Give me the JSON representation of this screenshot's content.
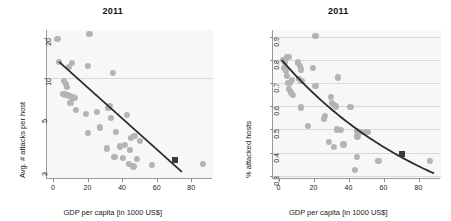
{
  "figure": {
    "background": "#ffffff",
    "point_color": "#b4b4b4",
    "highlight_color": "#3a3a3a",
    "fit_color": "#2b2b2b",
    "grid_color": "#d9d9d9",
    "panel_background": "#f7f7f7"
  },
  "chart_data": [
    {
      "type": "scatter",
      "title": "2011",
      "xlabel": "GDP per capita [in 1000 US$]",
      "ylabel": "Avg. # attacks per host",
      "xlim": [
        -4,
        92
      ],
      "ylim": [
        1.8,
        23
      ],
      "yscale": "log",
      "xscale": "linear",
      "xticks": [
        0,
        20,
        40,
        60,
        80
      ],
      "xtick_labels": [
        "0",
        "20",
        "40",
        "60",
        "80"
      ],
      "yticks": [
        2,
        5,
        10,
        20
      ],
      "ytick_labels": [
        "2",
        "5",
        "10",
        "20"
      ],
      "grid": "horizontal-at-10",
      "gridlines_y": [
        10
      ],
      "legend": "none",
      "points": [
        {
          "x": 2.0,
          "y": 19.8
        },
        {
          "x": 20.5,
          "y": 21.5
        },
        {
          "x": 3.0,
          "y": 13.2
        },
        {
          "x": 8.5,
          "y": 12.1
        },
        {
          "x": 10.5,
          "y": 13.0
        },
        {
          "x": 19.5,
          "y": 12.4
        },
        {
          "x": 34.0,
          "y": 11.0
        },
        {
          "x": 6.0,
          "y": 9.6
        },
        {
          "x": 7.0,
          "y": 9.1
        },
        {
          "x": 7.5,
          "y": 8.6
        },
        {
          "x": 5.5,
          "y": 7.7
        },
        {
          "x": 6.5,
          "y": 7.6
        },
        {
          "x": 8.0,
          "y": 7.5
        },
        {
          "x": 9.0,
          "y": 7.4
        },
        {
          "x": 10.0,
          "y": 7.3
        },
        {
          "x": 11.0,
          "y": 7.2
        },
        {
          "x": 12.0,
          "y": 7.1
        },
        {
          "x": 9.5,
          "y": 6.6
        },
        {
          "x": 12.5,
          "y": 5.8
        },
        {
          "x": 18.5,
          "y": 5.4
        },
        {
          "x": 25.0,
          "y": 5.6
        },
        {
          "x": 31.5,
          "y": 6.0
        },
        {
          "x": 32.5,
          "y": 6.2
        },
        {
          "x": 33.0,
          "y": 5.1
        },
        {
          "x": 42.0,
          "y": 5.3
        },
        {
          "x": 19.5,
          "y": 3.9
        },
        {
          "x": 26.5,
          "y": 4.3
        },
        {
          "x": 36.0,
          "y": 4.0
        },
        {
          "x": 44.5,
          "y": 3.6
        },
        {
          "x": 46.5,
          "y": 3.7
        },
        {
          "x": 49.5,
          "y": 3.4
        },
        {
          "x": 30.5,
          "y": 3.0
        },
        {
          "x": 38.0,
          "y": 3.1
        },
        {
          "x": 41.0,
          "y": 3.2
        },
        {
          "x": 44.0,
          "y": 2.9
        },
        {
          "x": 35.0,
          "y": 2.6
        },
        {
          "x": 40.0,
          "y": 2.55
        },
        {
          "x": 43.5,
          "y": 2.3
        },
        {
          "x": 48.0,
          "y": 2.5
        },
        {
          "x": 46.0,
          "y": 2.2
        },
        {
          "x": 56.5,
          "y": 2.25
        },
        {
          "x": 86.0,
          "y": 2.3
        }
      ],
      "highlight_point": {
        "x": 70.0,
        "y": 2.45,
        "marker": "square"
      },
      "fit": {
        "type": "log-linear",
        "x_start": 3.0,
        "y_start": 13.3,
        "x_end": 74.0,
        "y_end": 2.0
      }
    },
    {
      "type": "scatter",
      "title": "2011",
      "xlabel": "GDP per capita [in 1000 US$]",
      "ylabel": "% attacked hosts",
      "xlim": [
        -4,
        92
      ],
      "ylim": [
        0.29,
        0.93
      ],
      "yscale": "linear",
      "xscale": "linear",
      "xticks": [
        0,
        20,
        40,
        60,
        80
      ],
      "xtick_labels": [
        "0",
        "20",
        "40",
        "60",
        "80"
      ],
      "yticks": [
        0.3,
        0.4,
        0.5,
        0.6,
        0.7,
        0.8,
        0.9
      ],
      "ytick_labels": [
        "0.3",
        "0.4",
        "0.5",
        "0.6",
        "0.7",
        "0.8",
        "0.9"
      ],
      "grid": "horizontal",
      "gridlines_y": [
        0.3,
        0.4,
        0.5,
        0.6,
        0.7,
        0.8,
        0.9
      ],
      "legend": "none",
      "points": [
        {
          "x": 20.5,
          "y": 0.905
        },
        {
          "x": 2.0,
          "y": 0.8
        },
        {
          "x": 3.0,
          "y": 0.79
        },
        {
          "x": 4.5,
          "y": 0.815
        },
        {
          "x": 5.5,
          "y": 0.815
        },
        {
          "x": 2.5,
          "y": 0.765
        },
        {
          "x": 3.5,
          "y": 0.755
        },
        {
          "x": 10.5,
          "y": 0.79
        },
        {
          "x": 11.5,
          "y": 0.775
        },
        {
          "x": 12.0,
          "y": 0.76
        },
        {
          "x": 19.0,
          "y": 0.765
        },
        {
          "x": 4.0,
          "y": 0.73
        },
        {
          "x": 5.0,
          "y": 0.7
        },
        {
          "x": 6.0,
          "y": 0.7
        },
        {
          "x": 7.0,
          "y": 0.715
        },
        {
          "x": 11.0,
          "y": 0.72
        },
        {
          "x": 12.5,
          "y": 0.71
        },
        {
          "x": 20.5,
          "y": 0.69
        },
        {
          "x": 33.5,
          "y": 0.725
        },
        {
          "x": 5.5,
          "y": 0.675
        },
        {
          "x": 6.5,
          "y": 0.66
        },
        {
          "x": 7.5,
          "y": 0.65
        },
        {
          "x": 29.5,
          "y": 0.64
        },
        {
          "x": 30.0,
          "y": 0.615
        },
        {
          "x": 31.0,
          "y": 0.605
        },
        {
          "x": 32.0,
          "y": 0.6
        },
        {
          "x": 12.0,
          "y": 0.595
        },
        {
          "x": 40.5,
          "y": 0.597
        },
        {
          "x": 26.0,
          "y": 0.56
        },
        {
          "x": 25.5,
          "y": 0.545
        },
        {
          "x": 16.0,
          "y": 0.515
        },
        {
          "x": 33.0,
          "y": 0.5
        },
        {
          "x": 35.0,
          "y": 0.497
        },
        {
          "x": 44.0,
          "y": 0.492
        },
        {
          "x": 46.5,
          "y": 0.49
        },
        {
          "x": 49.5,
          "y": 0.49
        },
        {
          "x": 50.5,
          "y": 0.488
        },
        {
          "x": 44.5,
          "y": 0.47
        },
        {
          "x": 28.0,
          "y": 0.445
        },
        {
          "x": 36.5,
          "y": 0.435
        },
        {
          "x": 31.0,
          "y": 0.425
        },
        {
          "x": 44.0,
          "y": 0.38
        },
        {
          "x": 56.5,
          "y": 0.365
        },
        {
          "x": 86.0,
          "y": 0.365
        },
        {
          "x": 43.0,
          "y": 0.325
        }
      ],
      "highlight_point": {
        "x": 70.0,
        "y": 0.392,
        "marker": "square"
      },
      "fit": {
        "type": "decay-curve",
        "x_start": 1.0,
        "y_start": 0.8,
        "x_end": 88.0,
        "y_end": 0.31
      }
    }
  ]
}
